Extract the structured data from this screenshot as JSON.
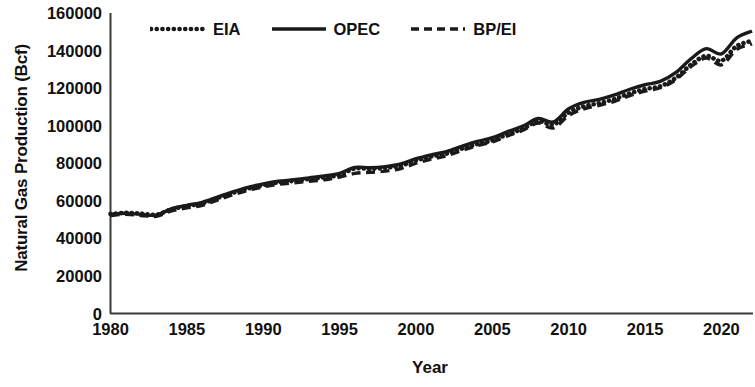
{
  "chart_data": {
    "type": "line",
    "title": "",
    "xlabel": "Year",
    "ylabel": "Natural Gas Production (Bcf)",
    "xlim": [
      1980,
      2022
    ],
    "ylim": [
      0,
      160000
    ],
    "grid": false,
    "legend_position": "top-left-inside",
    "x_ticks": [
      1980,
      1985,
      1990,
      1995,
      2000,
      2005,
      2010,
      2015,
      2020
    ],
    "y_ticks": [
      0,
      20000,
      40000,
      60000,
      80000,
      100000,
      120000,
      140000,
      160000
    ],
    "x": [
      1980,
      1981,
      1982,
      1983,
      1984,
      1985,
      1986,
      1987,
      1988,
      1989,
      1990,
      1991,
      1992,
      1993,
      1994,
      1995,
      1996,
      1997,
      1998,
      1999,
      2000,
      2001,
      2002,
      2003,
      2004,
      2005,
      2006,
      2007,
      2008,
      2009,
      2010,
      2011,
      2012,
      2013,
      2014,
      2015,
      2016,
      2017,
      2018,
      2019,
      2020,
      2021,
      2022
    ],
    "series": [
      {
        "name": "EIA",
        "style": "dotted",
        "color": "#1a1a1a",
        "values": [
          53000,
          53600,
          53200,
          52600,
          55500,
          57200,
          58600,
          61500,
          64200,
          66500,
          68400,
          69800,
          70600,
          71600,
          72500,
          73800,
          77200,
          77000,
          77600,
          78800,
          81500,
          83600,
          85100,
          87800,
          90200,
          92200,
          95400,
          98400,
          102400,
          100600,
          107000,
          110300,
          112000,
          114200,
          117200,
          119500,
          121000,
          125400,
          132400,
          137200,
          134600,
          142400,
          145200
        ]
      },
      {
        "name": "OPEC",
        "style": "solid",
        "color": "#1a1a1a",
        "values": [
          52800,
          53400,
          52800,
          52400,
          55800,
          57600,
          59200,
          62000,
          64800,
          67200,
          69000,
          70400,
          71200,
          72200,
          73200,
          74600,
          77800,
          77600,
          78200,
          79600,
          82400,
          84500,
          86200,
          89000,
          91600,
          93600,
          96800,
          99800,
          103800,
          102000,
          109000,
          112400,
          114000,
          116400,
          119400,
          121800,
          123600,
          128200,
          135600,
          141000,
          138200,
          146800,
          150400
        ]
      },
      {
        "name": "BP/EI",
        "style": "dashed",
        "color": "#1a1a1a",
        "values": [
          52200,
          52800,
          52200,
          51800,
          54600,
          56200,
          57600,
          60400,
          63200,
          65600,
          67400,
          68800,
          69600,
          70400,
          71200,
          72600,
          74600,
          75200,
          75800,
          77200,
          80000,
          82200,
          84000,
          86800,
          89400,
          91400,
          94600,
          97600,
          101400,
          98800,
          105400,
          109000,
          110800,
          113000,
          116000,
          118400,
          120200,
          124400,
          131400,
          136000,
          132400,
          140600,
          143600
        ]
      }
    ]
  },
  "axis": {
    "y_tick_labels": [
      "160000",
      "140000",
      "120000",
      "100000",
      "80000",
      "60000",
      "40000",
      "20000",
      "0"
    ],
    "x_tick_labels": [
      "1980",
      "1985",
      "1990",
      "1995",
      "2000",
      "2005",
      "2010",
      "2015",
      "2020"
    ],
    "y_title": "Natural Gas Production (Bcf)",
    "x_title": "Year"
  },
  "legend": {
    "items": [
      {
        "label": "EIA",
        "style": "dotted"
      },
      {
        "label": "OPEC",
        "style": "solid"
      },
      {
        "label": "BP/EI",
        "style": "dashed"
      }
    ]
  },
  "colors": {
    "ink": "#1a1a1a",
    "axis": "#3a3a3a",
    "background": "#ffffff"
  }
}
